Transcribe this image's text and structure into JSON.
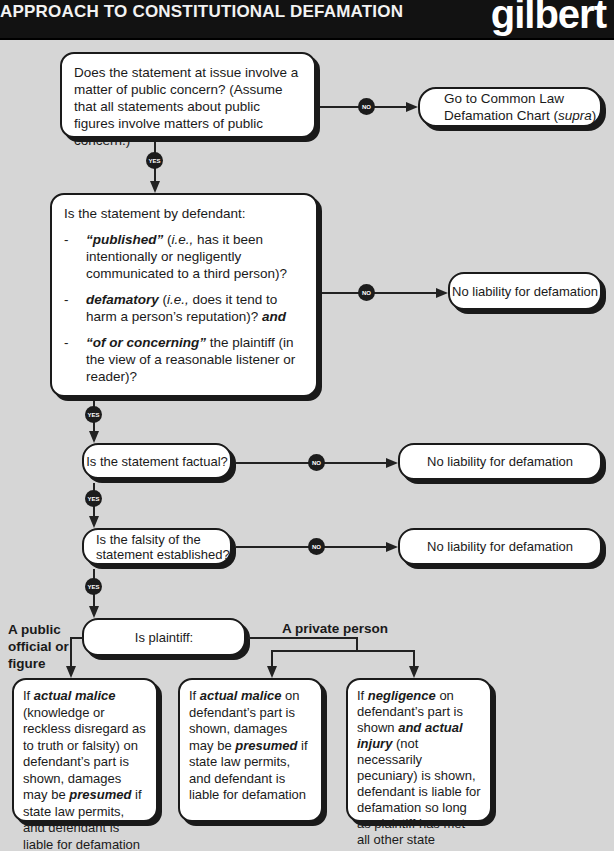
{
  "header": {
    "title": "APPROACH TO CONSTITUTIONAL DEFAMATION",
    "logo": "gilbert"
  },
  "colors": {
    "header_bg": "#121212",
    "page_bg": "#d6d6d6",
    "box_bg": "#ffffff",
    "outline": "#1a1a1a",
    "badge_bg": "#1c1c1c"
  },
  "badges": {
    "yes": "YES",
    "no": "NO"
  },
  "nodes": {
    "public_concern": {
      "text": "Does the statement at issue involve a matter of public concern? (Assume that all statements about public figures involve matters of public concern.)"
    },
    "common_law": {
      "text_a": "Go to Common Law",
      "text_b": "Defamation Chart (",
      "text_italic": "supra",
      "text_c": ")"
    },
    "elements": {
      "intro": "Is the statement by defendant:",
      "items": [
        {
          "dash": "-",
          "bold": "“published”",
          "pre": " (",
          "italic": "i.e.,",
          "rest": " has it been intentionally or negligently communicated to a third person)?"
        },
        {
          "dash": "-",
          "bold": "defamatory",
          "pre": " (",
          "italic": "i.e.,",
          "rest": " does it tend to harm a person’s reputation)? ",
          "tail_bold": "and"
        },
        {
          "dash": "-",
          "bold": "“of or concerning”",
          "pre": "",
          "italic": "",
          "rest": " the plaintiff (in the view of a reasonable listener or reader)?"
        }
      ]
    },
    "no_liability_1": {
      "text": "No liability for defamation"
    },
    "factual": {
      "text": "Is the statement factual?"
    },
    "no_liability_2": {
      "text": "No liability for defamation"
    },
    "falsity": {
      "text": "Is the falsity of the statement established?"
    },
    "no_liability_3": {
      "text": "No liability for defamation"
    },
    "plaintiff": {
      "text": "Is plaintiff:"
    }
  },
  "branches": {
    "public": "A public official or figure",
    "private": "A private person"
  },
  "outcomes": [
    {
      "p1": "If ",
      "b1": "actual malice",
      "p2": " (knowledge or reckless disregard as to truth or falsity) on defendant’s part is shown, damages may be ",
      "b2": "presumed",
      "p3": " if state law permits, and defendant is liable for defamation"
    },
    {
      "p1": "If ",
      "b1": "actual malice",
      "p2": " on defendant’s part is shown, damages may be ",
      "b2": "presumed",
      "p3": " if state law permits, and defendant is liable for defamation"
    },
    {
      "p1": "If ",
      "b1": "negligence",
      "p2": " on defendant’s part is shown ",
      "b2": "and actual injury",
      "p3": " (not necessarily pecuniary) is shown, defendant is liable for defamation so long as plaintiff has met all other state damage requirements"
    }
  ]
}
